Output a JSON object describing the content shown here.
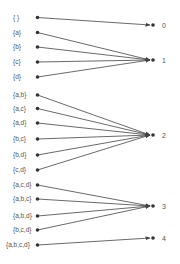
{
  "diagram": {
    "type": "mapping",
    "colors": {
      "line": "#444444",
      "dot": "#333333",
      "text": "#555555"
    },
    "left_nodes": [
      {
        "label": "{ }",
        "x": 37.5,
        "y": 17.5,
        "label_x": 13,
        "target": 0
      },
      {
        "label": "{a}",
        "x": 37.5,
        "y": 32.5,
        "label_x": 13,
        "target": 1
      },
      {
        "label": "{b}",
        "x": 37.5,
        "y": 47,
        "label_x": 13,
        "target": 1
      },
      {
        "label": "{c}",
        "x": 37.5,
        "y": 62,
        "label_x": 13,
        "target": 1
      },
      {
        "label": "{d}",
        "x": 37.5,
        "y": 77,
        "label_x": 13,
        "target": 1
      },
      {
        "label": "{a,b}",
        "x": 37.5,
        "y": 95,
        "label_x": 13,
        "target": 2
      },
      {
        "label": "{a,c}",
        "x": 37.5,
        "y": 108.5,
        "label_x": 13,
        "target": 2
      },
      {
        "label": "{a,d}",
        "x": 37.5,
        "y": 123,
        "label_x": 13,
        "target": 2
      },
      {
        "label": "{b,c}",
        "x": 37.5,
        "y": 139,
        "label_x": 13,
        "target": 2
      },
      {
        "label": "{b,d}",
        "x": 37.5,
        "y": 155,
        "label_x": 13,
        "target": 2
      },
      {
        "label": "{c,d}",
        "x": 37.5,
        "y": 170,
        "label_x": 13,
        "target": 2
      },
      {
        "label": "{a,c,d}",
        "x": 37.5,
        "y": 185,
        "label_x": 13,
        "target": 3
      },
      {
        "label": "{a,b,c}",
        "x": 37.5,
        "y": 199,
        "label_x": 13,
        "target": 3
      },
      {
        "label": "{a,b,d}",
        "x": 37.5,
        "y": 216,
        "label_x": 13,
        "target": 3
      },
      {
        "label": "{b,c,d}",
        "x": 37.5,
        "y": 230,
        "label_x": 13,
        "target": 3
      },
      {
        "label": "{a,b,c,d}",
        "x": 37.5,
        "y": 245,
        "label_x": 6,
        "target": 4
      }
    ],
    "right_nodes": [
      {
        "label": "0",
        "x": 153,
        "y": 25
      },
      {
        "label": "1",
        "x": 153,
        "y": 60
      },
      {
        "label": "2",
        "x": 153,
        "y": 135
      },
      {
        "label": "3",
        "x": 153,
        "y": 206
      },
      {
        "label": "4",
        "x": 153,
        "y": 238
      }
    ]
  }
}
